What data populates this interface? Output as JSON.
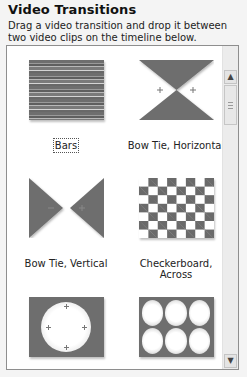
{
  "panel": {
    "title": "Video Transitions",
    "description": "Drag a video transition and drop it between two video clips on the timeline below."
  },
  "transitions": [
    {
      "label": "Bars",
      "icon": "bars-transition-icon",
      "selected": true
    },
    {
      "label": "Bow Tie, Horizontal",
      "icon": "bow-tie-horizontal-icon",
      "selected": false
    },
    {
      "label": "Bow Tie, Vertical",
      "icon": "bow-tie-vertical-icon",
      "selected": false
    },
    {
      "label": "Checkerboard, Across",
      "icon": "checkerboard-across-icon",
      "selected": false
    },
    {
      "label": "",
      "icon": "circle-transition-icon",
      "selected": false
    },
    {
      "label": "",
      "icon": "circles-transition-icon",
      "selected": false
    }
  ],
  "scrollbar": {
    "up_icon": "▲",
    "down_icon": "▼"
  },
  "colors": {
    "thumb_gray": "#6e6e6e",
    "panel_bg": "#f4f4f4",
    "list_bg": "#ffffff"
  }
}
